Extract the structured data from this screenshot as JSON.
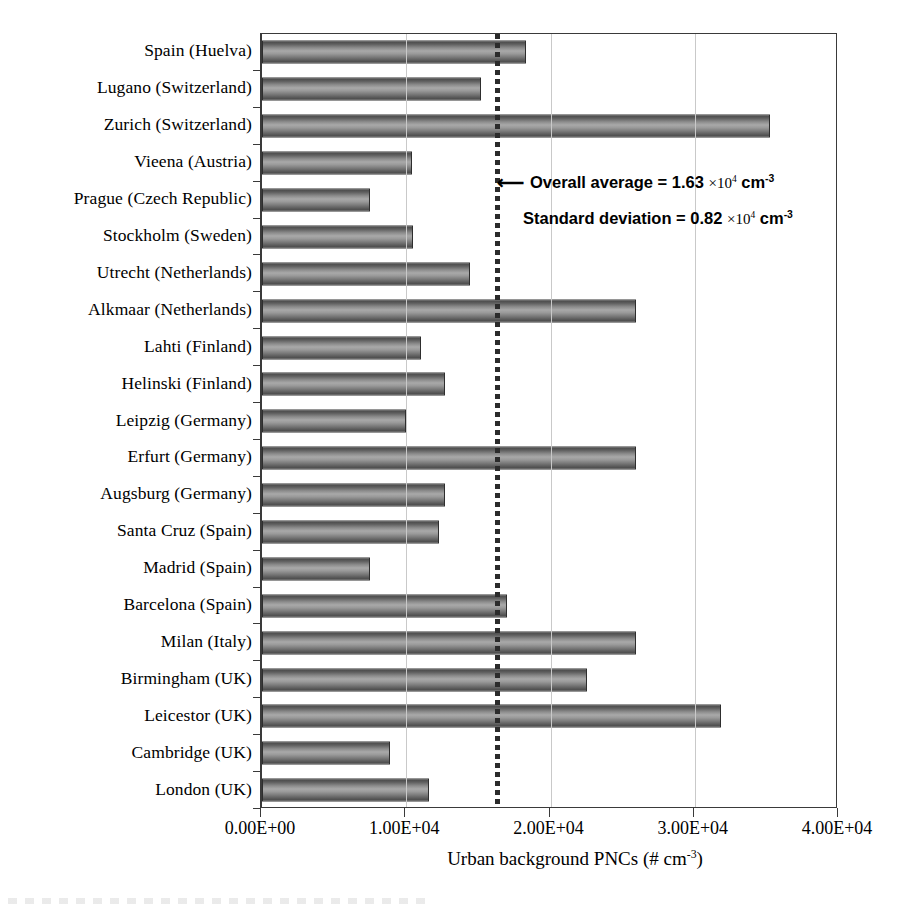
{
  "chart_data": {
    "type": "bar",
    "orientation": "horizontal",
    "title": "",
    "xlabel": "Urban background PNCs (# cm-3)",
    "xlabel_parts": {
      "text": "Urban background PNCs (# cm",
      "sup": "-3",
      "tail": ")"
    },
    "ylabel": "",
    "xlim": [
      0,
      40000
    ],
    "xticks": [
      0,
      10000,
      20000,
      30000,
      40000
    ],
    "xticklabels": [
      "0.00E+00",
      "1.00E+04",
      "2.00E+04",
      "3.00E+04",
      "4.00E+04"
    ],
    "grid": "vertical-dashed",
    "legend": "none",
    "bar_color": "#808080",
    "bar_edge_color": "#2e2e2e",
    "categories": [
      "Spain (Huelva)",
      "Lugano (Switzerland)",
      "Zurich (Switzerland)",
      "Vieena (Austria)",
      "Prague (Czech Republic)",
      "Stockholm (Sweden)",
      "Utrecht (Netherlands)",
      "Alkmaar (Netherlands)",
      "Lahti (Finland)",
      "Helinski (Finland)",
      "Leipzig (Germany)",
      "Erfurt (Germany)",
      "Augsburg (Germany)",
      "Santa Cruz (Spain)",
      "Madrid (Spain)",
      "Barcelona (Spain)",
      "Milan (Italy)",
      "Birmingham (UK)",
      "Leicestor (UK)",
      "Cambridge (UK)",
      "London (UK)"
    ],
    "values": [
      18300,
      15200,
      35200,
      10400,
      7500,
      10500,
      14400,
      25900,
      11000,
      12700,
      10000,
      25900,
      12700,
      12300,
      7500,
      17000,
      25900,
      22500,
      31800,
      8900,
      11600
    ],
    "reference_line": {
      "name": "overall-average",
      "value": 16300,
      "style": "dotted",
      "color": "#2b2b2b"
    },
    "annotations": [
      {
        "name": "overall-average-annotation",
        "arrow": "←",
        "prefix": "Overall average = 1.63 ",
        "times": "×10",
        "exp": "4",
        "unit": " cm",
        "unit_exp": "-3"
      },
      {
        "name": "standard-deviation-annotation",
        "arrow": "",
        "prefix": "Standard deviation = 0.82 ",
        "times": "×10",
        "exp": "4",
        "unit": " cm",
        "unit_exp": "-3"
      }
    ],
    "statistics": {
      "overall_average": 16300,
      "standard_deviation": 8200,
      "units": "# cm-3"
    }
  }
}
